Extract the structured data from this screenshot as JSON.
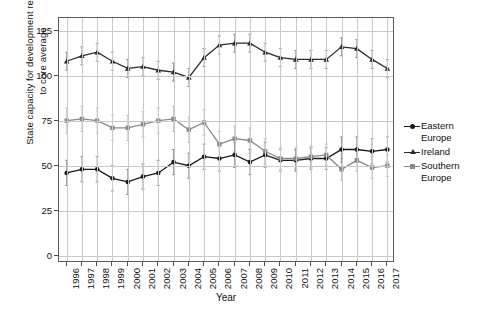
{
  "chart_data": {
    "type": "line",
    "title": "",
    "xlabel": "Year",
    "ylabel": "State capacity for development relative\nto core average",
    "x": [
      1996,
      1997,
      1998,
      1999,
      2000,
      2001,
      2002,
      2003,
      2004,
      2005,
      2006,
      2007,
      2008,
      2009,
      2010,
      2011,
      2012,
      2013,
      2014,
      2015,
      2016,
      2017
    ],
    "xticklabels": [
      "1996",
      "1997",
      "1998",
      "1999",
      "2000",
      "2001",
      "2002",
      "2003",
      "2004",
      "2005",
      "2006",
      "2007",
      "2008",
      "2009",
      "2010",
      "2011",
      "2012",
      "2013",
      "2014",
      "2015",
      "2016",
      "2017"
    ],
    "yticklabels": [
      "0",
      "25",
      "50",
      "75",
      "100",
      "125"
    ],
    "yticks": [
      0,
      25,
      50,
      75,
      100,
      125
    ],
    "ylim": [
      -4,
      132
    ],
    "grid": true,
    "legend_position": "right",
    "errorbars": true,
    "series": [
      {
        "name": "Eastern Europe",
        "marker": "circle",
        "color": "#1a1a1a",
        "values": [
          46,
          48,
          48,
          43,
          41,
          44,
          46,
          52,
          50,
          55,
          54,
          56,
          52,
          56,
          53,
          53,
          54,
          54,
          59,
          59,
          58,
          59
        ],
        "err_low": [
          39,
          41,
          41,
          36,
          34,
          37,
          39,
          45,
          43,
          48,
          47,
          49,
          45,
          49,
          47,
          47,
          48,
          48,
          52,
          52,
          51,
          52
        ],
        "err_high": [
          53,
          55,
          55,
          50,
          48,
          51,
          53,
          59,
          57,
          62,
          61,
          63,
          59,
          63,
          59,
          59,
          60,
          60,
          66,
          66,
          65,
          66
        ]
      },
      {
        "name": "Ireland",
        "marker": "triangle",
        "color": "#2b2b2b",
        "values": [
          108,
          111,
          113,
          108,
          104,
          105,
          103,
          102,
          99,
          110,
          117,
          118,
          118,
          113,
          110,
          109,
          109,
          109,
          116,
          115,
          109,
          104
        ],
        "err_low": [
          103,
          106,
          108,
          103,
          99,
          100,
          98,
          97,
          94,
          105,
          112,
          113,
          113,
          108,
          105,
          104,
          104,
          104,
          111,
          110,
          104,
          99
        ],
        "err_high": [
          113,
          116,
          118,
          113,
          109,
          110,
          108,
          107,
          104,
          115,
          122,
          123,
          123,
          118,
          115,
          114,
          114,
          114,
          121,
          120,
          114,
          109
        ]
      },
      {
        "name": "Southern Europe",
        "marker": "square",
        "color": "#8a8a8a",
        "values": [
          75,
          76,
          75,
          71,
          71,
          73,
          75,
          76,
          70,
          74,
          62,
          65,
          64,
          58,
          54,
          54,
          55,
          56,
          48,
          53,
          49,
          50
        ],
        "err_low": [
          68,
          69,
          68,
          64,
          64,
          66,
          68,
          69,
          63,
          67,
          55,
          58,
          57,
          51,
          48,
          48,
          49,
          50,
          42,
          47,
          43,
          44
        ],
        "err_high": [
          82,
          83,
          82,
          78,
          78,
          80,
          82,
          83,
          77,
          81,
          69,
          72,
          71,
          65,
          60,
          60,
          61,
          62,
          54,
          59,
          55,
          56
        ]
      }
    ]
  },
  "legend": {
    "items": [
      {
        "label": "Eastern\nEurope",
        "marker": "circle",
        "color": "#1a1a1a"
      },
      {
        "label": "Ireland",
        "marker": "triangle",
        "color": "#2b2b2b"
      },
      {
        "label": "Southern\nEurope",
        "marker": "square",
        "color": "#8a8a8a"
      }
    ]
  }
}
